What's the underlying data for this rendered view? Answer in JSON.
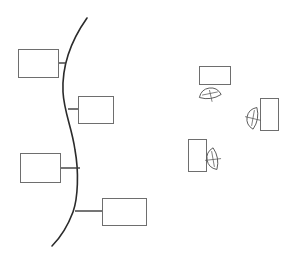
{
  "diagram": {
    "width": 291,
    "height": 259,
    "colors": {
      "background": "#ffffff",
      "spine": "#2b2b2b",
      "box_stroke": "#6e6e6e",
      "connector": "#3a3a3a",
      "chair_stroke": "#555555"
    },
    "spine": {
      "path": "M87,18 C68,45 62,70 63,92 C64,112 72,128 75,150 C79,172 78,198 73,212 C67,228 60,238 52,246"
    },
    "branch_boxes": [
      {
        "id": "box-1",
        "x": 18,
        "y": 49,
        "w": 40,
        "h": 28,
        "connector": {
          "x1": 58,
          "y1": 63,
          "x2": 66,
          "y2": 63
        }
      },
      {
        "id": "box-2",
        "x": 78,
        "y": 96,
        "w": 35,
        "h": 27,
        "connector": {
          "x1": 68,
          "y1": 109,
          "x2": 78,
          "y2": 109
        }
      },
      {
        "id": "box-3",
        "x": 20,
        "y": 153,
        "w": 40,
        "h": 29,
        "connector": {
          "x1": 60,
          "y1": 168,
          "x2": 80,
          "y2": 168
        }
      },
      {
        "id": "box-4",
        "x": 102,
        "y": 198,
        "w": 44,
        "h": 27,
        "connector": {
          "x1": 75,
          "y1": 211,
          "x2": 102,
          "y2": 211
        }
      }
    ],
    "workstations": [
      {
        "id": "workstation-1",
        "desk": {
          "x": 199,
          "y": 66,
          "w": 31,
          "h": 18
        },
        "chair": {
          "cx": 210,
          "cy": 94,
          "rx": 11,
          "ry": 6,
          "rot": -8
        }
      },
      {
        "id": "workstation-2",
        "desk": {
          "x": 260,
          "y": 98,
          "w": 18,
          "h": 32
        },
        "chair": {
          "cx": 253,
          "cy": 118,
          "rx": 6,
          "ry": 11,
          "rot": 10
        }
      },
      {
        "id": "workstation-3",
        "desk": {
          "x": 188,
          "y": 139,
          "w": 18,
          "h": 32
        },
        "chair": {
          "cx": 213,
          "cy": 159,
          "rx": 6,
          "ry": 11,
          "rot": -10
        }
      }
    ]
  }
}
